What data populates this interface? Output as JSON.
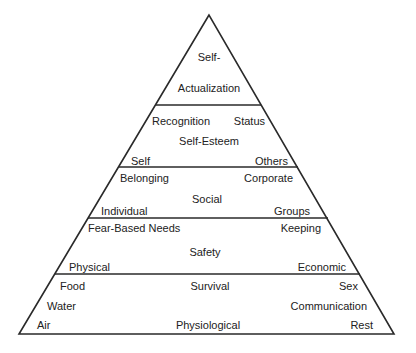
{
  "diagram": {
    "type": "pyramid",
    "colors": {
      "stroke": "#2a2a2a",
      "text": "#222222",
      "background": "#ffffff"
    },
    "levels": [
      {
        "name": "Self-Actualization",
        "lines": [
          "Self-",
          "Actualization"
        ]
      },
      {
        "name": "Self-Esteem",
        "center": "Self-Esteem",
        "top_left": "Recognition",
        "top_right": "Status",
        "bottom_left": "Self",
        "bottom_right": "Others"
      },
      {
        "name": "Social",
        "center": "Social",
        "top_left": "Belonging",
        "top_right": "Corporate",
        "bottom_left": "Individual",
        "bottom_right": "Groups"
      },
      {
        "name": "Safety",
        "center": "Safety",
        "top_left": "Fear-Based Needs",
        "top_right": "Keeping",
        "bottom_left": "Physical",
        "bottom_right": "Economic"
      },
      {
        "name": "Physiological",
        "top_center": "Survival",
        "bottom_center": "Physiological",
        "top_left": "Food",
        "middle_left": "Water",
        "bottom_left": "Air",
        "top_right": "Sex",
        "middle_right": "Communication",
        "bottom_right": "Rest"
      }
    ]
  }
}
